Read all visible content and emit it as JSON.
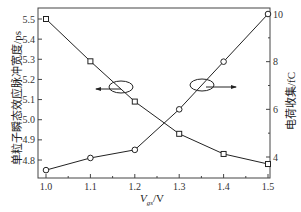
{
  "chart_data": {
    "type": "line",
    "title": "",
    "xlabel": "V_gs/V",
    "xlabel_main": "V",
    "xlabel_sub": "gs",
    "xlabel_unit": "/V",
    "ylabel_left": "单粒子瞬态效应脉冲宽度/ps",
    "ylabel_right": "电荷收集/fC",
    "x": [
      1.0,
      1.1,
      1.2,
      1.3,
      1.4,
      1.5
    ],
    "x_ticks": [
      "1.0",
      "1.1",
      "1.2",
      "1.3",
      "1.4",
      "1.5"
    ],
    "y_left_ticks": [
      "4.8",
      "4.9",
      "5.0",
      "5.1",
      "5.2",
      "5.3",
      "5.4",
      "5.5"
    ],
    "y_right_ticks": [
      "4",
      "6",
      "8",
      "10"
    ],
    "ylim_left": [
      4.75,
      5.55
    ],
    "ylim_right": [
      3.2,
      10.2
    ],
    "xlim": [
      0.98,
      1.52
    ],
    "grid": false,
    "series": [
      {
        "name": "单粒子瞬态效应脉冲宽度",
        "axis": "left",
        "marker": "square",
        "values": [
          5.5,
          5.29,
          5.09,
          4.93,
          4.83,
          4.78
        ]
      },
      {
        "name": "电荷收集",
        "axis": "right",
        "marker": "circle",
        "values": [
          3.45,
          3.96,
          4.3,
          6.0,
          8.0,
          10.0
        ]
      }
    ],
    "annotations": [
      {
        "text": "ellipse with arrow pointing left",
        "target_axis": "left",
        "series": "square"
      },
      {
        "text": "ellipse with arrow pointing right",
        "target_axis": "right",
        "series": "circle"
      }
    ]
  }
}
